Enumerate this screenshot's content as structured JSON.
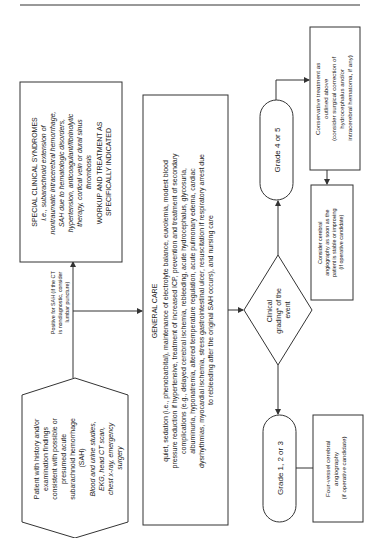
{
  "nodes": {
    "patient": {
      "lines": [
        "Patient with history and/or",
        "examination findings",
        "consistent with possible or",
        "presumed acute",
        "subarachnoid hemorrhage",
        "(SAH)"
      ],
      "italic_lines": [
        "Blood and urine studies,",
        "EKG, head CT scan,",
        "chest x-ray, emergency",
        "surgery"
      ]
    },
    "positive_label": {
      "lines": [
        "Positive for SAH (if the CT",
        "is nondiagnostic, consider",
        "lumbar puncture)"
      ]
    },
    "special": {
      "lines": [
        "SPECIAL CLINICAL SYNDROMES",
        "i.e., subarachnoid extension of",
        "nontraumatic intracerebral hemorrhage,",
        "SAH due to hematologic disorders,",
        "hypertension, anticoagulant/fibrinolytic",
        "therapy, cortical vein or dural sinus",
        "thrombosis",
        "WORKUP AND TREATMENT AS",
        "SPECIFICALLY INDICATED"
      ]
    },
    "general_care": {
      "title": "GENERAL CARE",
      "lines": [
        "quiet, sedation (i.e., phenobarbital), maintenance of electrolyte balance, euvolemia, modest blood",
        "pressure reduction if hypertensive, treatment of increased ICP, prevention and treatment of secondary",
        "complications (e.g., delayed cerebral ischemia, rebleeding, acute hydrocephalus, glycosuria,",
        "albuminuria, hyponatremia, altered temperature regulation, acute pulmonary edema, cardiac",
        "dysrhythmias, myocardial ischemia, stress gastrointestinal ulcer, resuscitation if respiratory arrest due",
        "to rebleeding after the original SAH occurs), and nursing care"
      ]
    },
    "grading": {
      "lines": [
        "Clinical",
        "grading* of the",
        "event"
      ]
    },
    "grade_high": {
      "label": "Grade 4 or 5"
    },
    "grade_low": {
      "label": "Grade 1, 2 or 3"
    },
    "conservative": {
      "lines": [
        "Conservative treatment as",
        "outlined above",
        "(consider surgical correction of",
        "hydrocephalus and/or",
        "intracerebral hematoma, if any)"
      ]
    },
    "consider_angio": {
      "lines": [
        "Consider cerebral",
        "angiography as soon as the",
        "patient is stable or improving",
        "(if operative candidate)"
      ]
    },
    "four_vessel": {
      "lines": [
        "Four-vessel cerebral",
        "angiography",
        "(if operative candidate)"
      ]
    }
  },
  "colors": {
    "stroke": "#333333",
    "text": "#222222",
    "background": "#ffffff"
  }
}
